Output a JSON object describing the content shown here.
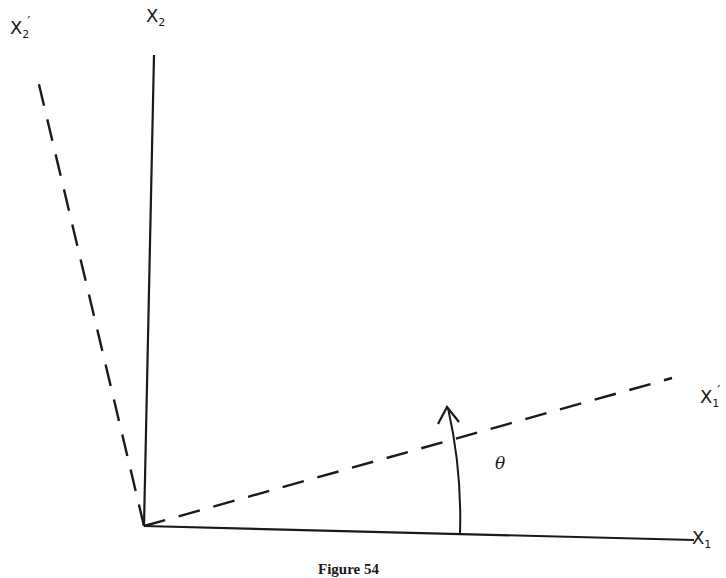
{
  "figure": {
    "caption": "Figure 54",
    "angle_label": "θ",
    "axes": {
      "x1": {
        "base": "X",
        "sub": "1",
        "prime": ""
      },
      "x2": {
        "base": "X",
        "sub": "2",
        "prime": ""
      },
      "x1p": {
        "base": "X",
        "sub": "1",
        "prime": "′"
      },
      "x2p": {
        "base": "X",
        "sub": "2",
        "prime": "′"
      }
    },
    "colors": {
      "ink": "#1a1a1a",
      "background": "#ffffff"
    }
  }
}
